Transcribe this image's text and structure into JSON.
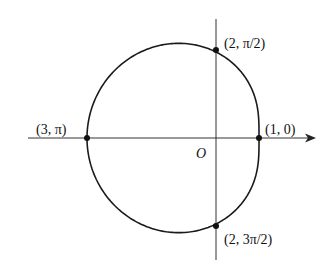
{
  "diagram": {
    "type": "polar-curve",
    "equation": "r = 2 - cos θ",
    "origin_label": "O",
    "scale_px_per_unit": 43,
    "origin_px": [
      216,
      138
    ],
    "points": [
      {
        "id": "p0",
        "label": "(1, 0)",
        "r": 1,
        "theta": "0"
      },
      {
        "id": "p1",
        "label": "(2, π/2)",
        "r": 2,
        "theta": "π/2"
      },
      {
        "id": "p2",
        "label": "(3, π)",
        "r": 3,
        "theta": "π"
      },
      {
        "id": "p3",
        "label": "(2, 3π/2)",
        "r": 2,
        "theta": "3π/2"
      }
    ],
    "colors": {
      "curve": "#1a1a1a",
      "axis": "#333333",
      "background": "#ffffff"
    }
  }
}
